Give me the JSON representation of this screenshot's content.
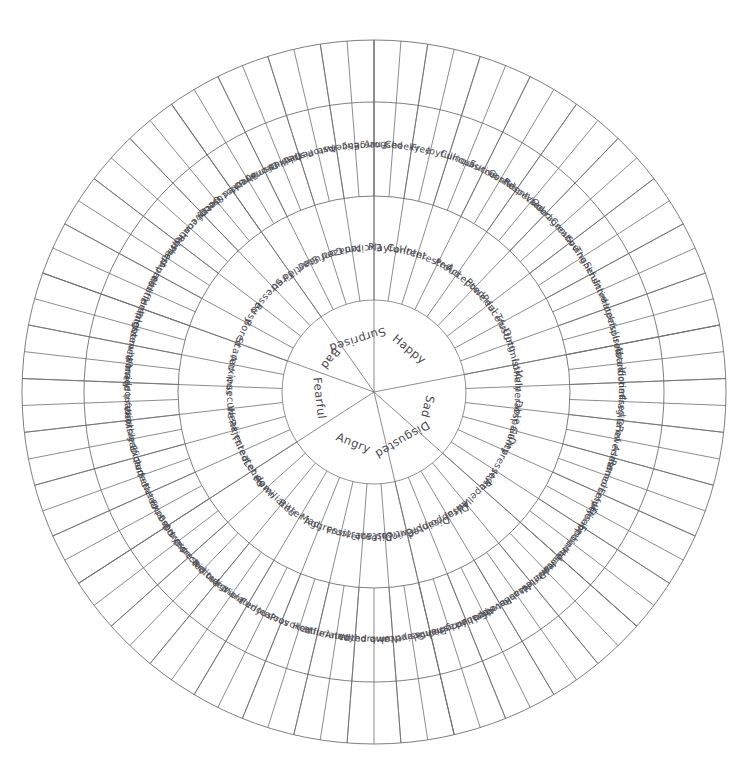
{
  "diagram": {
    "type": "radial-hierarchy",
    "rings": 3,
    "colors": {
      "stroke": "#6f6f72",
      "text": "#4a4a4f",
      "background": "#ffffff"
    },
    "geometry": {
      "center_x": 374,
      "center_y": 392,
      "core_radius": 92,
      "mid_radius": 196,
      "outer_radius": 290,
      "rim_radius": 352,
      "start_angle_deg": -90
    }
  },
  "core": [
    {
      "label": "Happy",
      "secondary": [
        {
          "label": "Playful",
          "tertiary": [
            "Aroused",
            "Cheeky"
          ]
        },
        {
          "label": "Content",
          "tertiary": [
            "Free",
            "Joyful"
          ]
        },
        {
          "label": "Interested",
          "tertiary": [
            "Curious",
            "Inquisitive"
          ]
        },
        {
          "label": "Proud",
          "tertiary": [
            "Successful",
            "Confident"
          ]
        },
        {
          "label": "Accepted",
          "tertiary": [
            "Respected",
            "Valued"
          ]
        },
        {
          "label": "Powerful",
          "tertiary": [
            "Courageous",
            "Creative"
          ]
        },
        {
          "label": "Peaceful",
          "tertiary": [
            "Loving",
            "Thankful"
          ]
        },
        {
          "label": "Trusting",
          "tertiary": [
            "Sensitive",
            "Intimate"
          ]
        },
        {
          "label": "Optimistic",
          "tertiary": [
            "Hopeful",
            "Inspired"
          ]
        }
      ]
    },
    {
      "label": "Sad",
      "secondary": [
        {
          "label": "Lonely",
          "tertiary": [
            "Isolated",
            "Abandoned"
          ]
        },
        {
          "label": "Vulnerable",
          "tertiary": [
            "Victimised",
            "Fragile"
          ]
        },
        {
          "label": "Despair",
          "tertiary": [
            "Grief",
            "Powerless"
          ]
        },
        {
          "label": "Guilty",
          "tertiary": [
            "Ashamed",
            "Remorseful"
          ]
        },
        {
          "label": "Depressed",
          "tertiary": [
            "Empty",
            "Inferior"
          ]
        },
        {
          "label": "Hurt",
          "tertiary": [
            "Disappointed",
            "Embarrassed"
          ]
        }
      ]
    },
    {
      "label": "Disgusted",
      "secondary": [
        {
          "label": "Repelled",
          "tertiary": [
            "Hesitant",
            "Horrified"
          ]
        },
        {
          "label": "Awful",
          "tertiary": [
            "Detestable",
            "Nauseated"
          ]
        },
        {
          "label": "Disappointed",
          "tertiary": [
            "Revolted",
            "Appalled"
          ]
        },
        {
          "label": "Disapproving",
          "tertiary": [
            "Embarrassed",
            "Judgmental"
          ]
        }
      ]
    },
    {
      "label": "Angry",
      "secondary": [
        {
          "label": "Critical",
          "tertiary": [
            "Dismissive",
            "Sceptical"
          ]
        },
        {
          "label": "Distant",
          "tertiary": [
            "Numb",
            "Withdrawn"
          ]
        },
        {
          "label": "Frustrated",
          "tertiary": [
            "Annoyed",
            "Infuriated"
          ]
        },
        {
          "label": "Aggressive",
          "tertiary": [
            "Hostile",
            "Provoked"
          ]
        },
        {
          "label": "Mad",
          "tertiary": [
            "Jealous",
            "Furious"
          ]
        },
        {
          "label": "Bitter",
          "tertiary": [
            "Violated",
            "Indignant"
          ]
        },
        {
          "label": "Humiliated",
          "tertiary": [
            "Ridiculed",
            "Disrespected"
          ]
        },
        {
          "label": "Let down",
          "tertiary": [
            "Disrespected",
            "Betrayed"
          ]
        }
      ]
    },
    {
      "label": "Fearful",
      "secondary": [
        {
          "label": "Threatened",
          "tertiary": [
            "Exposed",
            "Nervous"
          ]
        },
        {
          "label": "Rejected",
          "tertiary": [
            "Persecuted",
            "Excluded"
          ]
        },
        {
          "label": "Weak",
          "tertiary": [
            "Insignificant",
            "Worthless"
          ]
        },
        {
          "label": "Insecure",
          "tertiary": [
            "Inferior",
            "Inadequate"
          ]
        },
        {
          "label": "Anxious",
          "tertiary": [
            "Worried",
            "Overwhelmed"
          ]
        },
        {
          "label": "Scared",
          "tertiary": [
            "Frightened",
            "Helpless"
          ]
        }
      ]
    },
    {
      "label": "Bad",
      "secondary": [
        {
          "label": "Bored",
          "tertiary": [
            "Indifferent",
            "Apathetic"
          ]
        },
        {
          "label": "Busy",
          "tertiary": [
            "Pressured",
            "Rushed"
          ]
        },
        {
          "label": "Stressed",
          "tertiary": [
            "Overwhelmed",
            "Out of control"
          ]
        },
        {
          "label": "Tired",
          "tertiary": [
            "Sleepy",
            "Unfocused"
          ]
        }
      ]
    },
    {
      "label": "Surprised",
      "secondary": [
        {
          "label": "Startled",
          "tertiary": [
            "Shocked",
            "Dismayed"
          ]
        },
        {
          "label": "Confused",
          "tertiary": [
            "Disillusioned",
            "Perplexed"
          ]
        },
        {
          "label": "Amazed",
          "tertiary": [
            "Astonished",
            "Awe"
          ]
        },
        {
          "label": "Excited",
          "tertiary": [
            "Eager",
            "Energetic"
          ]
        }
      ]
    }
  ]
}
